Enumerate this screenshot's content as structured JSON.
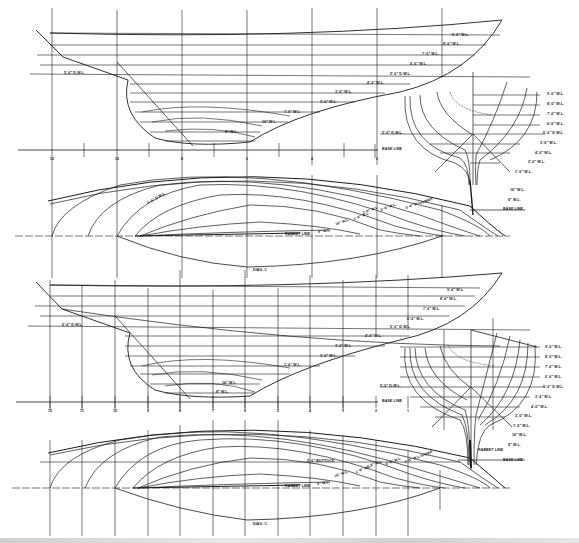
{
  "colors": {
    "ink": "#1a1a1a",
    "paper": "#ffffff"
  },
  "plan_1": {
    "waterlines_profile": [
      "9'-6\" W.L.",
      "8'-6\" W.L.",
      "7'-6\" W.L.",
      "6'-6\" W.L.",
      "5'-6\" D.W.L.",
      "4'-6\" W.L.",
      "3'-6\" W.L.",
      "2'-6\" W.L.",
      "1'-6\" W.L.",
      "16\" W.L.",
      "8\" W.L."
    ],
    "aft_label": "5'-6\" D.W.L.",
    "base_line": "BASE LINE",
    "stations": [
      "12",
      "10",
      "8",
      "6",
      "4",
      "2"
    ],
    "body_plan_labels": [
      "9'-6\" W.L.",
      "8'-6\" W.L.",
      "7'-6\" W.L.",
      "6'-6\" W.L.",
      "5'-6\" D.W.L.",
      "3'-6\" W.L.",
      "4'-0\" W.L.",
      "2'-6\" W.L.",
      "1'-6\" W.L.",
      "16\" W.L.",
      "8\" W.L."
    ],
    "body_plan_dwl": "5'-6\" D.W.L.",
    "half_breadth_labels": [
      "SHEER",
      "5'-6\" D.W.L.",
      "4'-6\" W.L.",
      "3'-6\" W.L.",
      "2'-6\" W.L.",
      "1'-6\" W.L.",
      "16\" W.L.",
      "8\" W.L.",
      "RABBET LINE",
      "DIAG. C"
    ]
  },
  "plan_2": {
    "waterlines_profile": [
      "9'-6\" W.L.",
      "8'-6\" W.L.",
      "7'-6\" W.L.",
      "6'-6\" W.L.",
      "5'-6\" D.W.L.",
      "4'-6\" W.L.",
      "3'-6\" W.L.",
      "2'-6\" W.L.",
      "1'-6\" W.L.",
      "16\" W.L.",
      "8\" W.L."
    ],
    "aft_label": "5'-6\" D.W.L.",
    "base_line": "BASE LINE",
    "stations": [
      "12",
      "11",
      "10",
      "9",
      "8",
      "7",
      "6",
      "5",
      "4",
      "3",
      "2",
      "1"
    ],
    "body_plan_labels": [
      "9'-6\" W.L.",
      "8'-6\" W.L.",
      "7'-6\" W.L.",
      "6'-6\" W.L.",
      "5'-6\" D.W.L.",
      "3'-6\" W.L.",
      "4'-0\" W.L.",
      "2'-6\" W.L.",
      "1'-6\" W.L.",
      "16\" W.L.",
      "8\" W.L."
    ],
    "body_plan_dwl": "5'-6\" D.W.L.",
    "rabbet_label": "RABBET LINE",
    "half_breadth_labels": [
      "SHEER",
      "5'-6\" BUTTOCK",
      "4'-6\" W.L.",
      "3'-6\" W.L.",
      "2'-6\" W.L.",
      "1'-6\" W.L.",
      "16\" W.L.",
      "8\" W.L.",
      "RABBET LINE",
      "DIAG. C"
    ]
  }
}
